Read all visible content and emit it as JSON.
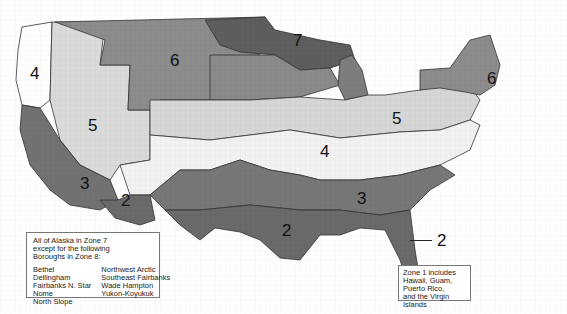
{
  "map": {
    "title": "Climate Zone Map",
    "colors": {
      "zone1": "#6a6a6a",
      "zone2": "#6a6a6a",
      "zone3": "#777777",
      "zone4": "#f2f2f2",
      "zone5": "#d6d6d6",
      "zone6": "#8c8c8c",
      "zone7": "#5e5e5e",
      "zone4_marine": "#ffffff",
      "border": "#333333"
    },
    "zone_labels": [
      {
        "id": "zone-4-northwest",
        "text": "4"
      },
      {
        "id": "zone-6-mountain",
        "text": "6"
      },
      {
        "id": "zone-7-north",
        "text": "7"
      },
      {
        "id": "zone-6-northeast",
        "text": "6"
      },
      {
        "id": "zone-5-west",
        "text": "5"
      },
      {
        "id": "zone-5-midwest",
        "text": "5"
      },
      {
        "id": "zone-4-central",
        "text": "4"
      },
      {
        "id": "zone-3-california",
        "text": "3"
      },
      {
        "id": "zone-2-arizona",
        "text": "2"
      },
      {
        "id": "zone-3-southeast",
        "text": "3"
      },
      {
        "id": "zone-2-texas",
        "text": "2"
      },
      {
        "id": "zone-2-florida",
        "text": "2"
      },
      {
        "id": "zone-1-florida",
        "text": "1"
      }
    ]
  },
  "alaska_note": {
    "line1": "All of Alaska in Zone 7",
    "line2": "except for the following",
    "line3": "Boroughs in Zone 8:",
    "boroughs_left": [
      "Bethel",
      "Dellingham",
      "Fairbanks N. Star",
      "Nome",
      "North Slope"
    ],
    "boroughs_right": [
      "Northwest Arctic",
      "Southeast Fairbanks",
      "Wade Hampton",
      "Yukon-Koyukuk"
    ]
  },
  "zone1_note": {
    "line1": "Zone 1 includes",
    "line2": "Hawaii, Guam,",
    "line3": "Puerto Rico,",
    "line4": "and the Virgin Islands"
  }
}
